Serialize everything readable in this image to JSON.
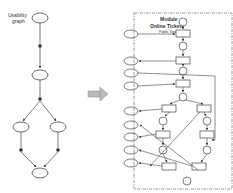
{
  "left_graph": {
    "title_line1": "Usability",
    "title_line2": "graph",
    "states": [
      {
        "id": "s1",
        "label": "s0",
        "cx": 40,
        "cy": 18
      },
      {
        "id": "s2",
        "label": "s1",
        "cx": 40,
        "cy": 75
      },
      {
        "id": "s3",
        "label": "s2",
        "cx": 21,
        "cy": 127
      },
      {
        "id": "s4",
        "label": "s3",
        "cx": 58,
        "cy": 127
      },
      {
        "id": "s5",
        "label": "s4",
        "cx": 40,
        "cy": 173
      }
    ],
    "transitions": [
      {
        "label": "t0",
        "x": 40,
        "y": 46
      },
      {
        "label": "t1",
        "x": 40,
        "y": 99
      },
      {
        "label": "t2",
        "x": 21,
        "y": 150
      },
      {
        "label": "t3",
        "x": 58,
        "y": 150
      }
    ],
    "edge_labels": [
      "[r]",
      "[a]",
      "[b]",
      "[a]",
      "[b]",
      "[c]",
      "[a]",
      "[e]",
      "[e]"
    ]
  },
  "arrow": {
    "direction": "right"
  },
  "right_module": {
    "title_line1": "Module",
    "title_line2": "Online Tickets",
    "subtitle": "Public View",
    "nodes": [
      "Tn",
      "Tr",
      "Tv",
      "Ts",
      "Tt",
      "Tp",
      "Tq",
      "Tu1",
      "Tu2"
    ]
  }
}
